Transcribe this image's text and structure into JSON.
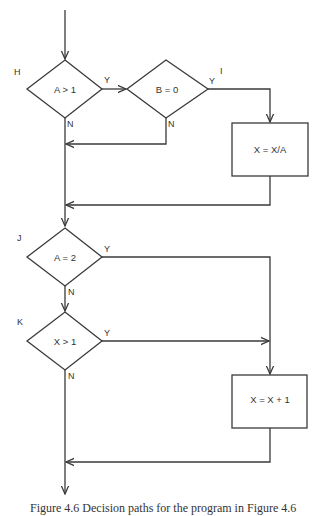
{
  "diagram": {
    "type": "flowchart",
    "nodes": {
      "H": {
        "label": "H",
        "text": "A > 1",
        "shape": "decision"
      },
      "I": {
        "label": "I",
        "text": "B = 0",
        "shape": "decision"
      },
      "box1": {
        "text": "X = X/A",
        "shape": "process"
      },
      "J": {
        "label": "J",
        "text": "A = 2",
        "shape": "decision"
      },
      "K": {
        "label": "K",
        "text": "X > 1",
        "shape": "decision"
      },
      "box2": {
        "text": "X = X + 1",
        "shape": "process"
      }
    },
    "edge_labels": {
      "yes": "Y",
      "no": "N"
    },
    "edges": [
      {
        "from": "start",
        "to": "H"
      },
      {
        "from": "H",
        "to": "I",
        "label": "Y"
      },
      {
        "from": "H",
        "to": "merge1",
        "label": "N"
      },
      {
        "from": "I",
        "to": "box1",
        "label": "Y"
      },
      {
        "from": "I",
        "to": "merge1",
        "label": "N"
      },
      {
        "from": "box1",
        "to": "merge2"
      },
      {
        "from": "merge2",
        "to": "J"
      },
      {
        "from": "J",
        "to": "box2",
        "label": "Y"
      },
      {
        "from": "J",
        "to": "K",
        "label": "N"
      },
      {
        "from": "K",
        "to": "box2",
        "label": "Y"
      },
      {
        "from": "K",
        "to": "merge3",
        "label": "N"
      },
      {
        "from": "box2",
        "to": "merge3"
      },
      {
        "from": "merge3",
        "to": "end"
      }
    ]
  },
  "caption": "Figure 4.6   Decision paths for the program in Figure 4.6"
}
